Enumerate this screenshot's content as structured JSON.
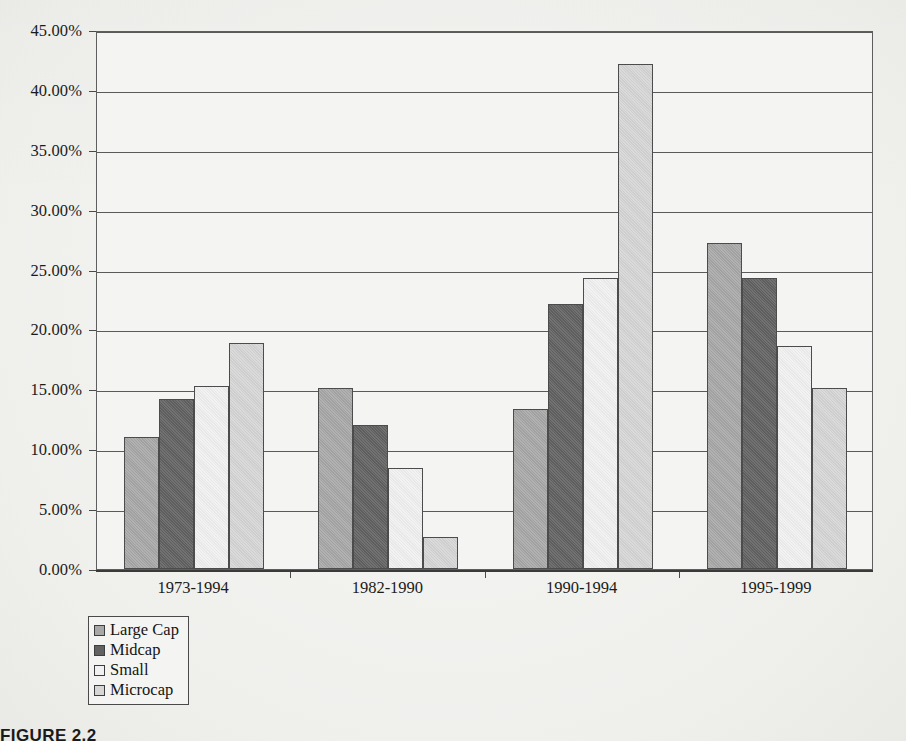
{
  "figure": {
    "caption": "FIGURE 2.2"
  },
  "legend": {
    "position": "bottom-left",
    "entries": [
      {
        "label": "Large Cap",
        "color": "#a8a8a8",
        "icon": "legend-swatch-icon"
      },
      {
        "label": "Midcap",
        "color": "#626262",
        "icon": "legend-swatch-icon"
      },
      {
        "label": "Small",
        "color": "#f1f1f1",
        "icon": "legend-swatch-icon"
      },
      {
        "label": "Microcap",
        "color": "#d6d6d6",
        "icon": "legend-swatch-icon"
      }
    ]
  },
  "axis": {
    "y_tick_labels": [
      "45.00%",
      "40.00%",
      "35.00%",
      "30.00%",
      "25.00%",
      "20.00%",
      "15.00%",
      "10.00%",
      "5.00%",
      "0.00%"
    ],
    "x_tick_labels": [
      "1973-1994",
      "1982-1990",
      "1990-1994",
      "1995-1999"
    ]
  },
  "chart_data": {
    "type": "bar",
    "title": "",
    "subtitle": "",
    "xlabel": "",
    "ylabel": "",
    "ylim": [
      0,
      45
    ],
    "ytick_step": 5,
    "ytick_format": "percent-2dp",
    "grid": true,
    "grid_axis": "y",
    "legend_position": "bottom-left",
    "categories": [
      "1973-1994",
      "1982-1990",
      "1990-1994",
      "1995-1999"
    ],
    "series": [
      {
        "name": "Large Cap",
        "color": "#a8a8a8",
        "values": [
          11.0,
          15.1,
          13.4,
          27.2
        ]
      },
      {
        "name": "Midcap",
        "color": "#626262",
        "values": [
          14.2,
          12.0,
          22.1,
          24.3
        ]
      },
      {
        "name": "Small",
        "color": "#f1f1f1",
        "values": [
          15.3,
          8.4,
          24.3,
          18.6
        ]
      },
      {
        "name": "Microcap",
        "color": "#d6d6d6",
        "values": [
          18.9,
          2.7,
          42.2,
          15.1
        ]
      }
    ]
  }
}
